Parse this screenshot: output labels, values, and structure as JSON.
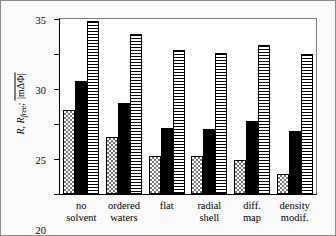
{
  "chart_data": {
    "type": "bar",
    "title": "",
    "xlabel": "",
    "ylabel": "R, Rfree; |mΔΦ|",
    "ylabel_parts": {
      "main": "R, R",
      "sub": "free",
      "separator": ";",
      "overlined": "|mΔΦ|"
    },
    "ylim": [
      10,
      35
    ],
    "yticks": [
      10,
      15,
      20,
      25,
      30,
      35
    ],
    "ytick_labels": [
      "10",
      "15",
      "20",
      "25",
      "30",
      "35"
    ],
    "grid": false,
    "legend": "none",
    "categories": [
      "no solvent",
      "ordered waters",
      "flat",
      "radial shell",
      "diff. map",
      "density modif."
    ],
    "category_lines": [
      [
        "no",
        "solvent"
      ],
      [
        "ordered",
        "waters"
      ],
      [
        "flat",
        ""
      ],
      [
        "radial",
        "shell"
      ],
      [
        "diff.",
        "map"
      ],
      [
        "density",
        "modif."
      ]
    ],
    "series": [
      {
        "name": "R",
        "pattern": "checkerboard",
        "color": "#707070",
        "values": [
          22.0,
          18.2,
          15.5,
          15.4,
          14.8,
          12.9
        ]
      },
      {
        "name": "Rfree",
        "pattern": "solid-black",
        "color": "#000000",
        "values": [
          26.1,
          23.0,
          19.4,
          19.3,
          20.4,
          19.0
        ]
      },
      {
        "name": "|mΔΦ|",
        "pattern": "horizontal-stripes",
        "color": "#000000",
        "values": [
          34.7,
          32.8,
          30.6,
          30.1,
          31.3,
          30.0
        ]
      }
    ]
  }
}
